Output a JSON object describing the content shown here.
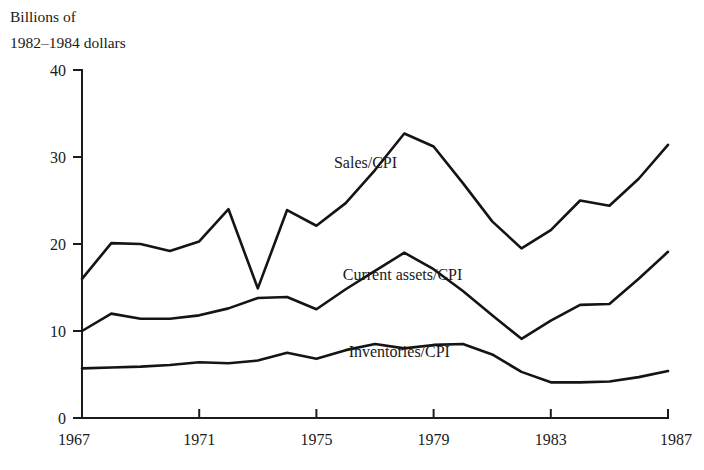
{
  "chart_data": {
    "type": "line",
    "title": "",
    "axis_title_lines": [
      "Billions of",
      "1982–1984 dollars"
    ],
    "xlabel": "",
    "ylabel": "Billions of 1982–1984 dollars",
    "xlim": [
      1967,
      1987
    ],
    "ylim": [
      0,
      40
    ],
    "yticks": [
      0,
      10,
      20,
      30,
      40
    ],
    "ytick_labels": [
      "0",
      "10",
      "20",
      "30",
      "40"
    ],
    "xticks": [
      1967,
      1971,
      1975,
      1979,
      1983,
      1987
    ],
    "xtick_labels": [
      "1967",
      "1971",
      "1975",
      "1979",
      "1983",
      "1987"
    ],
    "grid": false,
    "legend_position": "inline-annotations",
    "line_color": "#141414",
    "background_color": "#ffffff",
    "x": [
      1967,
      1968,
      1969,
      1970,
      1971,
      1972,
      1973,
      1974,
      1975,
      1976,
      1977,
      1978,
      1979,
      1980,
      1981,
      1982,
      1983,
      1984,
      1985,
      1986,
      1987
    ],
    "series": [
      {
        "name": "Sales/CPI",
        "label": "Sales/CPI",
        "label_x": 1975.6,
        "label_y": 28.7,
        "values": [
          16.0,
          20.1,
          20.0,
          19.2,
          20.3,
          24.0,
          14.9,
          23.9,
          22.1,
          24.7,
          28.5,
          32.7,
          31.2,
          27.0,
          22.6,
          19.5,
          21.6,
          25.0,
          24.4,
          27.5,
          31.4
        ]
      },
      {
        "name": "Current assets/CPI",
        "label": "Current assets/CPI",
        "label_x": 1975.9,
        "label_y": 15.9,
        "values": [
          10.0,
          12.0,
          11.4,
          11.4,
          11.8,
          12.6,
          13.8,
          13.9,
          12.5,
          14.8,
          16.9,
          19.0,
          17.1,
          14.6,
          11.8,
          9.1,
          11.2,
          13.0,
          13.1,
          16.0,
          19.1
        ]
      },
      {
        "name": "Inventories/CPI",
        "label": "Inventories/CPI",
        "label_x": 1976.1,
        "label_y": 7.0,
        "values": [
          5.7,
          5.8,
          5.9,
          6.1,
          6.4,
          6.3,
          6.6,
          7.5,
          6.8,
          7.8,
          8.5,
          8.0,
          8.4,
          8.5,
          7.3,
          5.3,
          4.1,
          4.1,
          4.2,
          4.7,
          5.4
        ]
      }
    ]
  }
}
